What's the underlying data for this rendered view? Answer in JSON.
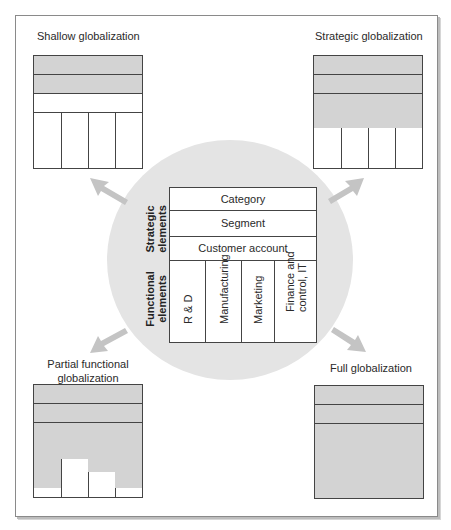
{
  "diagram": {
    "center": {
      "strategic_label": "Strategic\nelements",
      "functional_label": "Functional\nelements",
      "strategic_rows": [
        "Category",
        "Segment",
        "Customer account"
      ],
      "functional_cols": [
        "R & D",
        "Manufacturing",
        "Marketing",
        "Finance and\ncontrol, IT"
      ]
    },
    "quadrants": [
      {
        "id": "top-left",
        "title": "Shallow globalization",
        "strategic_shaded": [
          true,
          true,
          false
        ],
        "functional_shaded_fraction": [
          0,
          0,
          0,
          0
        ]
      },
      {
        "id": "top-right",
        "title": "Strategic globalization",
        "strategic_shaded": [
          true,
          true,
          true
        ],
        "functional_shaded_fraction": [
          0.29,
          0.29,
          0.29,
          0.29
        ]
      },
      {
        "id": "bottom-left",
        "title": "Partial functional globalization",
        "title_lines": [
          "Partial functional",
          "globalization"
        ],
        "strategic_shaded": [
          true,
          true,
          true
        ],
        "functional_shaded_fraction": [
          0.84,
          0.32,
          0.55,
          0.84
        ]
      },
      {
        "id": "bottom-right",
        "title": "Full globalization",
        "strategic_shaded": [
          true,
          true,
          true
        ],
        "functional_shaded_fraction": [
          1,
          1,
          1,
          1
        ]
      }
    ],
    "colors": {
      "circle": "#e4e4e4",
      "shade": "#d3d3d3",
      "arrow": "#c4c4c4",
      "line": "#444444"
    }
  }
}
